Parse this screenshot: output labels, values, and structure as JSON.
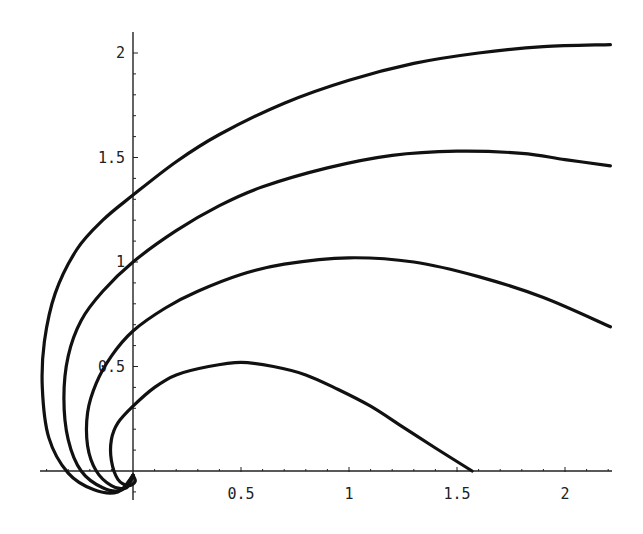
{
  "chart_data": {
    "type": "line",
    "title": "",
    "xlabel": "",
    "ylabel": "",
    "xlim": [
      -0.6,
      2.21
    ],
    "ylim": [
      -0.1,
      2.1
    ],
    "grid": false,
    "legend": null,
    "x_ticks": [
      {
        "value": 0.5,
        "label": "0.5"
      },
      {
        "value": 1,
        "label": "1"
      },
      {
        "value": 1.5,
        "label": "1.5"
      },
      {
        "value": 2,
        "label": "2"
      }
    ],
    "y_ticks": [
      {
        "value": 0.5,
        "label": "0.5"
      },
      {
        "value": 1,
        "label": "1"
      },
      {
        "value": 1.5,
        "label": "1.5"
      },
      {
        "value": 2,
        "label": "2"
      }
    ],
    "x_minor_step": 0.1,
    "y_minor_step": 0.1,
    "series": [
      {
        "name": "curve-1",
        "points": [
          [
            0.0,
            -0.02
          ],
          [
            0.01,
            -0.05
          ],
          [
            -0.02,
            -0.07
          ],
          [
            -0.07,
            -0.04
          ],
          [
            -0.1,
            0.05
          ],
          [
            -0.1,
            0.15
          ],
          [
            -0.07,
            0.23
          ],
          [
            0.0,
            0.31
          ],
          [
            0.1,
            0.4
          ],
          [
            0.2,
            0.46
          ],
          [
            0.35,
            0.5
          ],
          [
            0.5,
            0.52
          ],
          [
            0.65,
            0.5
          ],
          [
            0.8,
            0.46
          ],
          [
            0.95,
            0.39
          ],
          [
            1.1,
            0.31
          ],
          [
            1.25,
            0.21
          ],
          [
            1.4,
            0.11
          ],
          [
            1.57,
            0.0
          ]
        ]
      },
      {
        "name": "curve-2",
        "points": [
          [
            0.0,
            -0.02
          ],
          [
            -0.03,
            -0.08
          ],
          [
            -0.1,
            -0.07
          ],
          [
            -0.17,
            0.0
          ],
          [
            -0.21,
            0.12
          ],
          [
            -0.21,
            0.28
          ],
          [
            -0.17,
            0.42
          ],
          [
            -0.1,
            0.55
          ],
          [
            0.0,
            0.67
          ],
          [
            0.15,
            0.78
          ],
          [
            0.3,
            0.86
          ],
          [
            0.5,
            0.94
          ],
          [
            0.7,
            0.99
          ],
          [
            1.0,
            1.02
          ],
          [
            1.3,
            1.0
          ],
          [
            1.6,
            0.93
          ],
          [
            1.9,
            0.83
          ],
          [
            2.21,
            0.69
          ]
        ]
      },
      {
        "name": "curve-3",
        "points": [
          [
            0.0,
            -0.02
          ],
          [
            -0.05,
            -0.09
          ],
          [
            -0.14,
            -0.08
          ],
          [
            -0.24,
            0.0
          ],
          [
            -0.3,
            0.15
          ],
          [
            -0.32,
            0.35
          ],
          [
            -0.3,
            0.55
          ],
          [
            -0.24,
            0.72
          ],
          [
            -0.14,
            0.86
          ],
          [
            0.0,
            1.0
          ],
          [
            0.2,
            1.15
          ],
          [
            0.4,
            1.27
          ],
          [
            0.6,
            1.36
          ],
          [
            0.9,
            1.45
          ],
          [
            1.2,
            1.51
          ],
          [
            1.5,
            1.53
          ],
          [
            1.8,
            1.52
          ],
          [
            2.0,
            1.49
          ],
          [
            2.21,
            1.46
          ]
        ]
      },
      {
        "name": "curve-4",
        "points": [
          [
            0.0,
            -0.02
          ],
          [
            -0.07,
            -0.1
          ],
          [
            -0.18,
            -0.09
          ],
          [
            -0.3,
            -0.01
          ],
          [
            -0.39,
            0.16
          ],
          [
            -0.42,
            0.4
          ],
          [
            -0.41,
            0.62
          ],
          [
            -0.36,
            0.85
          ],
          [
            -0.26,
            1.06
          ],
          [
            -0.14,
            1.2
          ],
          [
            0.0,
            1.32
          ],
          [
            0.2,
            1.48
          ],
          [
            0.4,
            1.61
          ],
          [
            0.7,
            1.76
          ],
          [
            1.0,
            1.87
          ],
          [
            1.3,
            1.95
          ],
          [
            1.6,
            2.0
          ],
          [
            1.9,
            2.03
          ],
          [
            2.21,
            2.04
          ]
        ]
      }
    ]
  }
}
